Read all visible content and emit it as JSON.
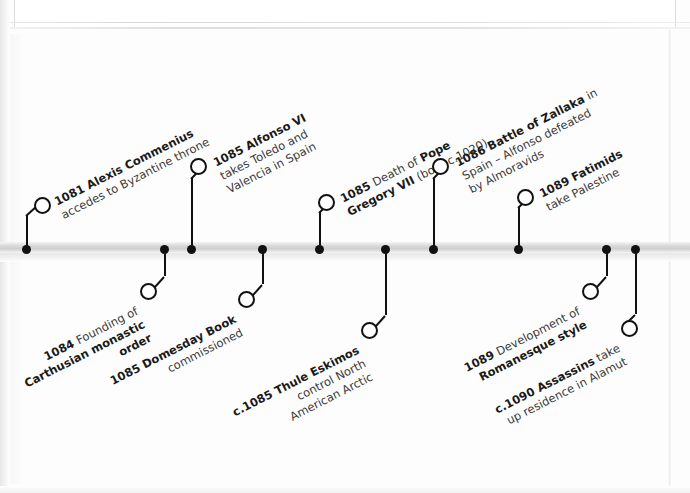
{
  "document": {
    "kind": "scanned-book-page",
    "title": "Timeline 1081-1090",
    "axis_color": "#d4d4d4",
    "ink_color": "#111111"
  },
  "timeline": {
    "axis_y": 249,
    "events": [
      {
        "id": "alexis-commenius",
        "side": "above",
        "year": "1081",
        "headline": "Alexis Commenius",
        "detail": "accedes to Byzantine throne",
        "lines": [
          "1081 Alexis Commenius",
          "accedes to Byzantine throne"
        ],
        "dot_x": 26,
        "ring_x": 42,
        "ring_y": 205,
        "angle": -27
      },
      {
        "id": "alfonso-vi",
        "side": "above",
        "year": "1085",
        "headline": "Alfonso VI",
        "detail": "takes Toledo and Valencia in Spain",
        "lines": [
          "1085 Alfonso VI",
          "takes Toledo and",
          "Valencia in Spain"
        ],
        "dot_x": 191,
        "ring_x": 198,
        "ring_y": 165,
        "angle": -27
      },
      {
        "id": "pope-gregory-vii",
        "side": "above",
        "year": "1085",
        "headline": "Pope Gregory VII",
        "detail": "Death of Pope Gregory VII (born c.1020)",
        "lines": [
          "1085 Death of Pope",
          "Gregory VII (born c.1020)"
        ],
        "dot_x": 319,
        "ring_x": 326,
        "ring_y": 202,
        "angle": -27
      },
      {
        "id": "battle-of-zallaka",
        "side": "above",
        "year": "1086",
        "headline": "Battle of Zallaka",
        "detail": "in Spain - Alfonso defeated by Almoravids",
        "lines": [
          "1086 Battle of Zallaka in",
          "Spain – Alfonso defeated",
          "by Almoravids"
        ],
        "dot_x": 433,
        "ring_x": 440,
        "ring_y": 165,
        "angle": -27
      },
      {
        "id": "fatimids-palestine",
        "side": "above",
        "year": "1089",
        "headline": "Fatimids",
        "detail": "take Palestine",
        "lines": [
          "1089 Fatimids",
          "take Palestine"
        ],
        "dot_x": 518,
        "ring_x": 525,
        "ring_y": 196,
        "angle": -27
      },
      {
        "id": "carthusian-order",
        "side": "below",
        "year": "1084",
        "headline": "Founding of Carthusian monastic order",
        "detail": "Founding of Carthusian monastic order",
        "lines": [
          "1084 Founding of",
          "Carthusian monastic",
          "order"
        ],
        "dot_x": 164,
        "ring_x": 148,
        "ring_y": 285,
        "angle": -27
      },
      {
        "id": "domesday-book",
        "side": "below",
        "year": "1085",
        "headline": "Domesday Book",
        "detail": "commissioned",
        "lines": [
          "1085 Domesday Book",
          "commissioned"
        ],
        "dot_x": 262,
        "ring_x": 246,
        "ring_y": 293,
        "angle": -27
      },
      {
        "id": "thule-eskimos",
        "side": "below",
        "year": "c.1085",
        "headline": "Thule Eskimos",
        "detail": "control North American Arctic",
        "lines": [
          "c.1085 Thule Eskimos",
          "control North",
          "American Arctic"
        ],
        "dot_x": 385,
        "ring_x": 369,
        "ring_y": 324,
        "angle": -27
      },
      {
        "id": "romanesque-style",
        "side": "below",
        "year": "1089",
        "headline": "Romanesque style",
        "detail": "Development of Romanesque style",
        "lines": [
          "1089 Development of",
          "Romanesque style"
        ],
        "dot_x": 606,
        "ring_x": 590,
        "ring_y": 285,
        "angle": -27
      },
      {
        "id": "assassins-alamut",
        "side": "below",
        "year": "c.1090",
        "headline": "Assassins",
        "detail": "take up residence in Alamut",
        "lines": [
          "c.1090 Assassins take",
          "up residence in Alamut"
        ],
        "dot_x": 635,
        "ring_x": 628,
        "ring_y": 322,
        "angle": -27
      }
    ]
  },
  "labels": {
    "e1": {
      "l1a": "1081 ",
      "l1b": "Alexis Commenius",
      "l2": "accedes to Byzantine throne"
    },
    "e2": {
      "l1a": "1085 ",
      "l1b": "Alfonso VI",
      "l2": "takes Toledo and",
      "l3": "Valencia in Spain"
    },
    "e3": {
      "l1a": "1085 ",
      "l1b": "Death of ",
      "l1c": "Pope",
      "l2a": "Gregory VII ",
      "l2b": "(born c.1020)"
    },
    "e4": {
      "l1a": "1086 ",
      "l1b": "Battle of Zallaka",
      "l1c": " in",
      "l2": "Spain – Alfonso defeated",
      "l3": "by Almoravids"
    },
    "e5": {
      "l1a": "1089 ",
      "l1b": "Fatimids",
      "l2": "take Palestine"
    },
    "e6": {
      "l1a": "1084 ",
      "l1b": "Founding of",
      "l2": "Carthusian monastic",
      "l3": "order"
    },
    "e7": {
      "l1a": "1085 ",
      "l1b": "Domesday Book",
      "l2": "commissioned"
    },
    "e8": {
      "l1a": "c.1085 ",
      "l1b": "Thule Eskimos",
      "l2": "control North",
      "l3": "American Arctic"
    },
    "e9": {
      "l1a": "1089 ",
      "l1b": "Development of",
      "l2": "Romanesque style"
    },
    "e10": {
      "l1a": "c.1090 ",
      "l1b": "Assassins",
      "l1c": " take",
      "l2": "up residence in Alamut"
    }
  }
}
